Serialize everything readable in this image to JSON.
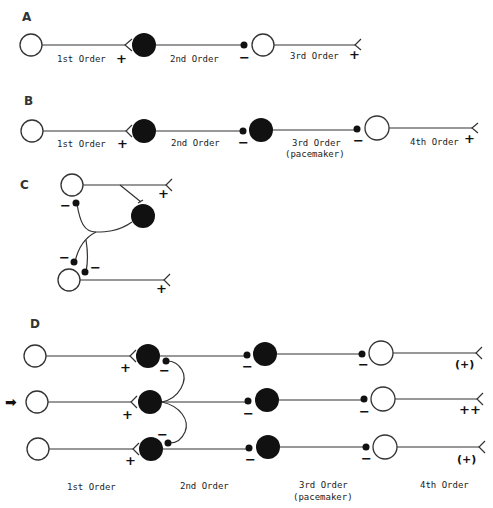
{
  "panels": {
    "A": {
      "label": "A",
      "orders": [
        "1st Order",
        "2nd Order",
        "3rd Order"
      ],
      "signs": [
        "+",
        "−",
        "+"
      ]
    },
    "B": {
      "label": "B",
      "orders": [
        "1st Order",
        "2nd Order",
        "3rd Order",
        "(pacemaker)",
        "4th Order"
      ],
      "signs": [
        "+",
        "−",
        "−",
        "+"
      ]
    },
    "C": {
      "label": "C",
      "signs": [
        "−",
        "+",
        "−",
        "−",
        "+"
      ]
    },
    "D": {
      "label": "D",
      "orders": [
        "1st Order",
        "2nd Order",
        "3rd Order",
        "(pacemaker)",
        "4th Order"
      ],
      "input_arrow": "➡",
      "rows": [
        {
          "first_sign": "+",
          "output": "(+)"
        },
        {
          "first_sign": "+",
          "output": "++"
        },
        {
          "first_sign": "+",
          "output": "(+)"
        }
      ],
      "inhib_sign": "−",
      "lateral_signs": [
        "−",
        "−"
      ]
    }
  },
  "colors": {
    "line": "#333333",
    "filled_cell": "#111111",
    "background": "#ffffff"
  }
}
